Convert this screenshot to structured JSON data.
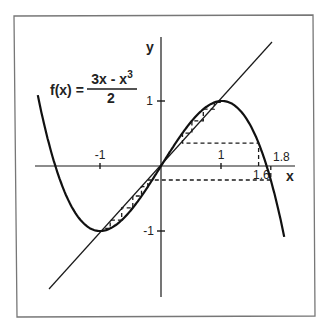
{
  "figure": {
    "formula": {
      "lhs": "f(x) =",
      "numerator": "3x - x",
      "numerator_exponent": "3",
      "denominator": "2"
    },
    "axes": {
      "x_label": "x",
      "y_label": "y",
      "x_ticks": [
        {
          "value": -1,
          "label": "-1"
        },
        {
          "value": 1,
          "label": "1"
        }
      ],
      "y_ticks": [
        {
          "value": 1,
          "label": "1"
        },
        {
          "value": -1,
          "label": "-1"
        }
      ]
    },
    "annotations": {
      "start_a": "1.6",
      "start_b": "1.8"
    },
    "colors": {
      "ink": "#1a1a1a",
      "frame": "#777777",
      "background": "#ffffff"
    }
  },
  "chart_data": {
    "type": "line",
    "xlabel": "x",
    "ylabel": "y",
    "xlim": [
      -2.05,
      2.1
    ],
    "ylim": [
      -2.0,
      1.95
    ],
    "grid": false,
    "series": [
      {
        "name": "f(x) = (3x - x^3)/2",
        "style": "solid-thick",
        "function": "(3x - x^3)/2"
      },
      {
        "name": "y = x",
        "style": "solid-thin",
        "function": "x"
      },
      {
        "name": "cobweb from x0 = 1.6",
        "style": "dashed",
        "x": [
          1.6,
          1.6,
          0.352,
          0.352,
          0.506,
          0.506,
          0.694,
          0.694,
          0.874,
          0.874,
          0.98
        ],
        "y": [
          0,
          0.352,
          0.352,
          0.506,
          0.506,
          0.694,
          0.694,
          0.874,
          0.874,
          0.98,
          0.98
        ]
      },
      {
        "name": "cobweb from x0 = 1.8",
        "style": "dashed",
        "x": [
          1.8,
          1.8,
          -0.216,
          -0.216,
          -0.319,
          -0.319,
          -0.462,
          -0.462,
          -0.644,
          -0.644,
          -0.832,
          -0.832,
          -0.96
        ],
        "y": [
          0,
          -0.216,
          -0.216,
          -0.319,
          -0.319,
          -0.462,
          -0.462,
          -0.644,
          -0.644,
          -0.832,
          -0.832,
          -0.96,
          -0.96
        ]
      }
    ],
    "annotations": [
      "f(x) = (3x - x^3)/2",
      "1.6",
      "1.8"
    ]
  }
}
